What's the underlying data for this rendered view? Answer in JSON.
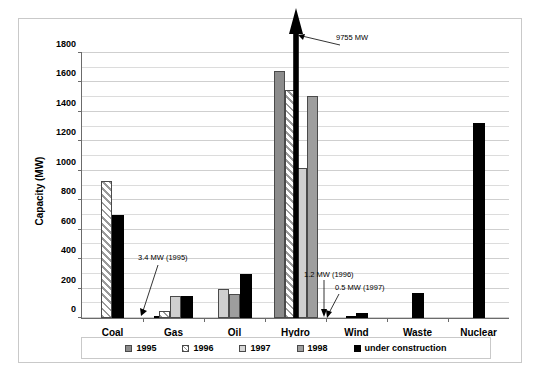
{
  "chart_data": {
    "type": "bar",
    "title": "",
    "xlabel": "",
    "ylabel": "Capacity (MW)",
    "ylim": [
      0,
      1800
    ],
    "yticks": [
      0,
      200,
      400,
      600,
      800,
      1000,
      1200,
      1400,
      1600,
      1800
    ],
    "grid": true,
    "legend_position": "bottom",
    "categories": [
      "Coal",
      "Gas",
      "Oil",
      "Hydro",
      "Wind",
      "Waste",
      "Nuclear"
    ],
    "series": [
      {
        "name": "1995",
        "values": [
          null,
          3.4,
          null,
          1675,
          1.2,
          null,
          null
        ]
      },
      {
        "name": "1996",
        "values": [
          350,
          50,
          null,
          1550,
          null,
          null,
          null
        ]
      },
      {
        "name": "1997",
        "values": [
          null,
          150,
          200,
          1020,
          0.5,
          null,
          null
        ]
      },
      {
        "name": "1998",
        "values": [
          null,
          null,
          160,
          1510,
          null,
          null,
          null
        ]
      },
      {
        "name": "under construction",
        "values": [
          700,
          150,
          300,
          9755,
          35,
          170,
          1325
        ]
      }
    ],
    "annotations": [
      {
        "text": "9755 MW",
        "target": "Hydro under construction"
      },
      {
        "text": "3.4 MW (1995)",
        "target": "Gas 1995"
      },
      {
        "text": "1.2 MW (1996)",
        "target": "Wind 1995"
      },
      {
        "text": "0.5 MW (1997)",
        "target": "Wind 1997"
      }
    ]
  },
  "axis": {
    "y_label": "Capacity (MW)",
    "ticks": [
      "1800",
      "1600",
      "1400",
      "1200",
      "1000",
      "800",
      "600",
      "400",
      "200",
      "0"
    ],
    "categories": [
      "Coal",
      "Gas",
      "Oil",
      "Hydro",
      "Wind",
      "Waste",
      "Nuclear"
    ]
  },
  "legend": {
    "items": [
      {
        "label": "1995",
        "key": "s1995"
      },
      {
        "label": "1996",
        "key": "s1996"
      },
      {
        "label": "1997",
        "key": "s1997"
      },
      {
        "label": "1998",
        "key": "s1998"
      },
      {
        "label": "under construction",
        "key": "sconstr"
      }
    ]
  },
  "annotations": {
    "hydro": "9755 MW",
    "gas": "3.4 MW (1995)",
    "wind_1996": "1.2 MW (1996)",
    "wind_1997": "0.5 MW (1997)"
  }
}
